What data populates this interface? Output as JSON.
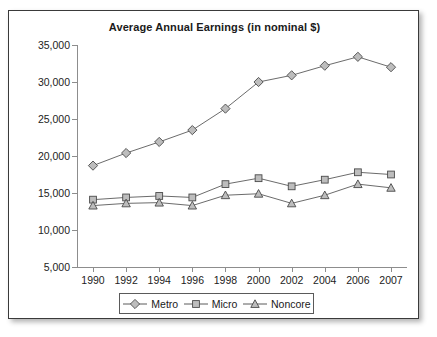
{
  "chart_data": {
    "type": "line",
    "title": "Average Annual Earnings (in nominal $)",
    "xlabel": "",
    "ylabel": "",
    "categories": [
      "1990",
      "1992",
      "1994",
      "1996",
      "1998",
      "2000",
      "2002",
      "2004",
      "2006",
      "2007"
    ],
    "ylim": [
      5000,
      35000
    ],
    "ytick_labels": [
      "35,000",
      "30,000",
      "25,000",
      "20,000",
      "15,000",
      "10,000",
      "5,000"
    ],
    "ytick_values": [
      35000,
      30000,
      25000,
      20000,
      15000,
      10000,
      5000
    ],
    "grid": false,
    "legend_position": "bottom",
    "series": [
      {
        "name": "Metro",
        "marker": "diamond",
        "values": [
          18700,
          20400,
          21900,
          23500,
          26400,
          30000,
          30900,
          32200,
          33400,
          32000
        ]
      },
      {
        "name": "Micro",
        "marker": "square",
        "values": [
          14100,
          14400,
          14600,
          14400,
          16200,
          17000,
          15900,
          16800,
          17800,
          17500
        ]
      },
      {
        "name": "Noncore",
        "marker": "triangle",
        "values": [
          13300,
          13600,
          13700,
          13300,
          14700,
          14900,
          13600,
          14700,
          16200,
          15700
        ]
      }
    ],
    "colors": {
      "line": "#5a5a5a",
      "marker_fill": "#bdbdbd",
      "marker_stroke": "#4a4a4a",
      "axis": "#8d8d8d",
      "text": "#1a1a1a",
      "frame": "#3a3a3a"
    }
  }
}
